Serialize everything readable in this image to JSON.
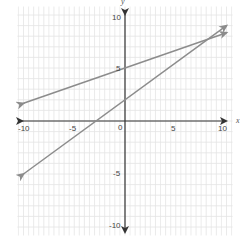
{
  "chart_data": {
    "type": "line",
    "title": "",
    "xlabel": "x",
    "ylabel": "y",
    "xlim": [
      -10,
      10
    ],
    "ylim": [
      -10,
      10
    ],
    "grid": true,
    "x_ticks": [
      "-10",
      "-5",
      "0",
      "5",
      "10"
    ],
    "y_ticks": [
      "10",
      "5",
      "-5",
      "-10"
    ],
    "series": [
      {
        "name": "line-1",
        "equation": "y = (1/3)x + 5",
        "points": [
          [
            -10,
            1.67
          ],
          [
            0,
            5
          ],
          [
            10,
            8.33
          ]
        ],
        "color": "#8c8c8c",
        "arrows": "both"
      },
      {
        "name": "line-2",
        "equation": "y = 0.7x + 2",
        "points": [
          [
            -10,
            -5
          ],
          [
            0,
            2
          ],
          [
            10,
            9
          ]
        ],
        "color": "#8c8c8c",
        "arrows": "both"
      }
    ],
    "intersection": [
      8.2,
      7.7
    ]
  },
  "labels": {
    "x_axis": "x",
    "y_axis": "y",
    "x_ticks": {
      "n10": "-10",
      "n5": "-5",
      "zero": "0",
      "p5": "5",
      "p10": "10"
    },
    "y_ticks": {
      "p10": "10",
      "p5": "5",
      "n5": "-5",
      "n10": "-10"
    }
  },
  "colors": {
    "grid": "#e4e4e4",
    "axis": "#333333",
    "line": "#8c8c8c"
  }
}
